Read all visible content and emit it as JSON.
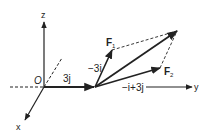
{
  "axes": {
    "x_label": "x",
    "y_label": "y",
    "z_label": "z",
    "origin_label": "O"
  },
  "vectors": {
    "displacement_label": "3j",
    "f1_label": "F",
    "f1_sub": "1",
    "f2_label": "F",
    "f2_sub": "2",
    "f1_component_label": "−3i",
    "f2_component_label": "−i+3j"
  },
  "colors": {
    "line": "#222222",
    "background": "#ffffff"
  }
}
